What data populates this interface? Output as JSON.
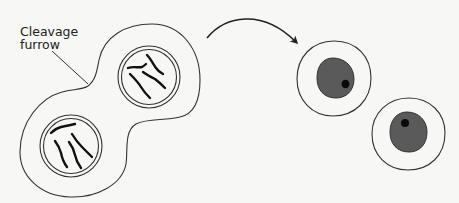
{
  "diagram": {
    "labels": {
      "cleavage_furrow_line1": "Cleavage",
      "cleavage_furrow_line2": "furrow"
    },
    "stages": [
      {
        "name": "dividing-cell",
        "description": "Cell pinching in at cleavage furrow, containing two nuclei each with 4 chromosomes",
        "nuclei": [
          {
            "position": "upper-right",
            "chromosome_count": 4
          },
          {
            "position": "lower-left",
            "chromosome_count": 4
          }
        ]
      },
      {
        "name": "daughter-cells",
        "description": "Two separated daughter cells, each with a dark nucleus and nucleolus",
        "count": 2
      }
    ],
    "colors": {
      "background": "#f7f7f5",
      "outline": "#333333",
      "chromosome": "#111111",
      "nucleus": "#5a5a5a",
      "nucleolus": "#0a0a0a"
    }
  }
}
